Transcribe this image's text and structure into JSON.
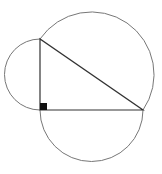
{
  "diagram": {
    "type": "right-triangle-with-semicircles",
    "background": "#ffffff",
    "triangle": {
      "stroke": "#333333",
      "vertices": {
        "right_angle": [
          40,
          110
        ],
        "top": [
          40,
          39
        ],
        "right": [
          143,
          110
        ]
      }
    },
    "right_angle_marker": {
      "x": 40,
      "y": 103,
      "size": 7,
      "fill": "#111111"
    },
    "semicircles": [
      {
        "name": "vertical-leg-semicircle",
        "center": [
          40,
          74.5
        ],
        "radius": 35.5,
        "side": "left"
      },
      {
        "name": "horizontal-leg-semicircle",
        "center": [
          91.5,
          110
        ],
        "radius": 51.5,
        "side": "bottom"
      },
      {
        "name": "hypotenuse-semicircle",
        "center": [
          91.5,
          74.5
        ],
        "radius": 62.6,
        "side": "outer"
      }
    ],
    "arc_stroke": "#777777"
  }
}
